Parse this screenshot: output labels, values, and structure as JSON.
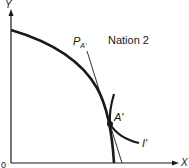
{
  "diagram": {
    "title": "Nation 2",
    "axes": {
      "y_label": "Y",
      "x_label": "X",
      "origin_label": "0"
    },
    "curves": {
      "ppf_label": "Production possibilities frontier",
      "indifference_label": "I'",
      "price_line_label_main": "P",
      "price_line_label_sub": "A'"
    },
    "points": {
      "equilibrium_label": "A'"
    },
    "colors": {
      "line": "#1a1a1a",
      "background": "#ffffff"
    }
  }
}
